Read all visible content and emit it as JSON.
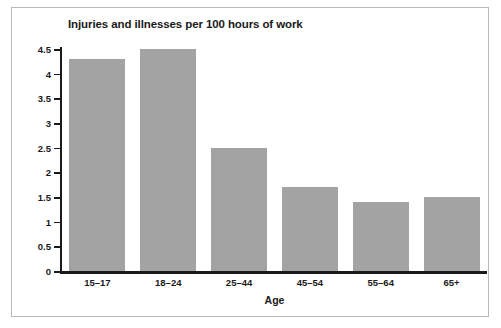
{
  "chart_data": {
    "type": "bar",
    "title": "Injuries and illnesses per 100 hours of work",
    "xlabel": "Age",
    "ylabel": "Number of Injuries/Illnesses",
    "categories": [
      "15–17",
      "18–24",
      "25–44",
      "45–54",
      "55–64",
      "65+"
    ],
    "values": [
      4.3,
      4.5,
      2.5,
      1.7,
      1.4,
      1.5
    ],
    "ylim": [
      0,
      4.5
    ],
    "yticks": [
      "0",
      "0.5",
      "1",
      "1.5",
      "2",
      "2.5",
      "3",
      "3.5",
      "4",
      "4.5"
    ],
    "ytick_values": [
      0,
      0.5,
      1,
      1.5,
      2,
      2.5,
      3,
      3.5,
      4,
      4.5
    ],
    "grid": false,
    "legend": null,
    "bar_color": "#a3a3a3",
    "axis_color": "#1a1a1a",
    "background": "#ffffff",
    "border_color": "#b9b9b9"
  }
}
